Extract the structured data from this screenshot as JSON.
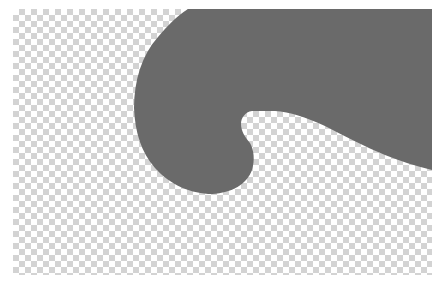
{
  "image": {
    "description": "Gray hook/wave shape on a transparent checkerboard background",
    "canvas": {
      "x": 13,
      "y": 9,
      "width": 419,
      "height": 266
    },
    "checkerboard": {
      "square_size": 6,
      "light": "#ffffff",
      "dark": "#d3d3d3"
    },
    "shape": {
      "fill": "#6a6a6a",
      "name": "hook-wave-shape"
    }
  }
}
